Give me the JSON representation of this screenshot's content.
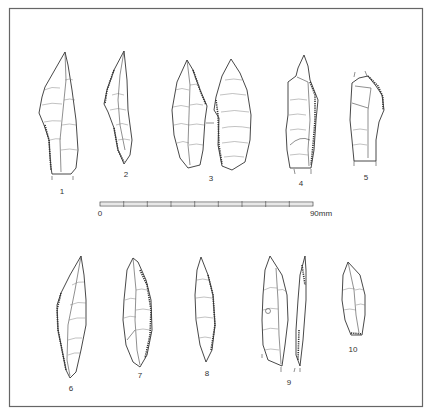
{
  "figure": {
    "type": "archaeological lithic illustration plate",
    "frame_color": "#666666",
    "ink_color": "#333333"
  },
  "scale_bar": {
    "start_label": "0",
    "end_label": "90mm",
    "segments": 9
  },
  "artifacts": [
    {
      "id": 1,
      "label": "1"
    },
    {
      "id": 2,
      "label": "2"
    },
    {
      "id": 3,
      "label": "3"
    },
    {
      "id": 4,
      "label": "4"
    },
    {
      "id": 5,
      "label": "5"
    },
    {
      "id": 6,
      "label": "6"
    },
    {
      "id": 7,
      "label": "7"
    },
    {
      "id": 8,
      "label": "8"
    },
    {
      "id": 9,
      "label": "9"
    },
    {
      "id": 10,
      "label": "10"
    }
  ]
}
